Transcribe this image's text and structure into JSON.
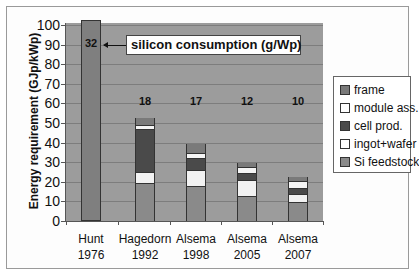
{
  "chart_data": {
    "type": "bar",
    "stacked": true,
    "title": "",
    "ylabel": "Energy requirement (GJp/kWp)",
    "xlabel": "",
    "ylim": [
      0,
      100
    ],
    "yticks": [
      0,
      10,
      20,
      30,
      40,
      50,
      60,
      70,
      80,
      90,
      100
    ],
    "grid": true,
    "legend_position": "right",
    "categories": [
      "Hunt 1976",
      "Hagedorn 1992",
      "Alsema 1998",
      "Alsema 2005",
      "Alsema 2007"
    ],
    "category_lines": [
      [
        "Hunt",
        "1976"
      ],
      [
        "Hagedorn",
        "1992"
      ],
      [
        "Alsema",
        "1998"
      ],
      [
        "Alsema",
        "2005"
      ],
      [
        "Alsema",
        "2007"
      ]
    ],
    "series": [
      {
        "name": "Si feedstock",
        "color": "#8a8a8a",
        "values": [
          null,
          19.5,
          18,
          13,
          9.5
        ]
      },
      {
        "name": "ingot+wafer",
        "color": "#f2f2f2",
        "values": [
          null,
          5.5,
          8,
          8,
          4.5
        ]
      },
      {
        "name": "cell prod.",
        "color": "#4a4a4a",
        "values": [
          null,
          22,
          6,
          3.5,
          3
        ]
      },
      {
        "name": "module ass.",
        "color": "#f5f5f5",
        "values": [
          null,
          2,
          2.5,
          3,
          3.5
        ]
      },
      {
        "name": "frame",
        "color": "#7a7a7a",
        "values": [
          null,
          3.5,
          5,
          2,
          2
        ]
      }
    ],
    "totals": [
      100,
      52.5,
      39.5,
      29.5,
      22.5
    ],
    "total_note": "Hunt 1976 bar is a single undivided bar exceeding the axis maximum (clipped at 100)",
    "annotations": {
      "silicon_consumption_label": "silicon consumption (g/Wp)",
      "silicon_consumption_values": [
        32,
        18,
        17,
        12,
        10
      ]
    }
  },
  "legend": {
    "items": [
      {
        "label": "frame",
        "color": "#7a7a7a"
      },
      {
        "label": "module ass.",
        "color": "#ffffff"
      },
      {
        "label": "cell prod.",
        "color": "#4a4a4a"
      },
      {
        "label": "ingot+wafer",
        "color": "#ffffff"
      },
      {
        "label": "Si feedstock",
        "color": "#8a8a8a"
      }
    ]
  },
  "colors": {
    "plot_background": "#9c9c9c",
    "hunt_bar": "#7f7f7f",
    "gridline": "#7d7d7d"
  }
}
